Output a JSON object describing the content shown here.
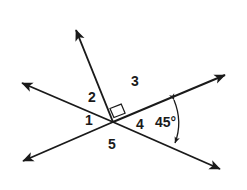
{
  "figure": {
    "background_color": "#ffffff",
    "stroke_color": "#1a1a1a",
    "vertex": {
      "x": 113,
      "y": 122
    },
    "angle_labels": [
      {
        "id": "1",
        "text": "1",
        "x": 85,
        "y": 113
      },
      {
        "id": "2",
        "text": "2",
        "x": 88,
        "y": 90
      },
      {
        "id": "3",
        "text": "3",
        "x": 131,
        "y": 74
      },
      {
        "id": "4",
        "text": "4",
        "x": 136,
        "y": 117
      },
      {
        "id": "5",
        "text": "5",
        "x": 108,
        "y": 137
      }
    ],
    "measures": [
      {
        "id": "angle-4-measure",
        "text": "45°",
        "x": 155,
        "y": 115
      }
    ],
    "right_angle_marker": {
      "present": true,
      "description": "small square between upward ray and upper-right ray"
    },
    "rays": [
      {
        "id": "ray-upper-left",
        "tip_x": 17,
        "tip_y": 80,
        "arrow": true
      },
      {
        "id": "ray-upper-right",
        "tip_x": 230,
        "tip_y": 72,
        "arrow": true
      },
      {
        "id": "ray-lower-left",
        "tip_x": 17,
        "tip_y": 165,
        "arrow": true
      },
      {
        "id": "ray-lower-right",
        "tip_x": 225,
        "tip_y": 173,
        "arrow": true
      },
      {
        "id": "ray-up-steep",
        "tip_x": 73,
        "tip_y": 23,
        "arrow": true
      }
    ],
    "arc": {
      "id": "angle-arc-45",
      "start_x": 174,
      "start_y": 97,
      "end_x": 175,
      "end_y": 146,
      "double_arrow": true
    }
  }
}
